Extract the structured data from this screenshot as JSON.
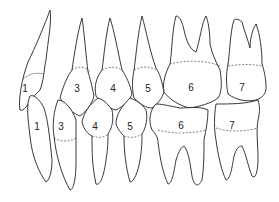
{
  "diagram": {
    "type": "dental occlusion line drawing",
    "upper_labels": [
      "1",
      "3",
      "4",
      "5",
      "6",
      "7"
    ],
    "lower_labels": [
      "1",
      "3",
      "4",
      "5",
      "6",
      "7"
    ],
    "colors": {
      "line": "#222222",
      "background": "#ffffff"
    }
  }
}
